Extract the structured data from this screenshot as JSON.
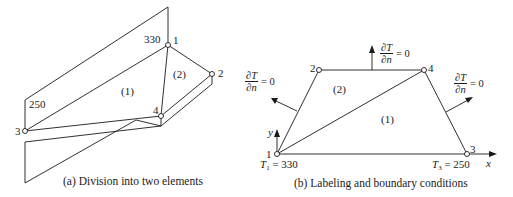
{
  "figure_a": {
    "caption": "(a) Division into two elements",
    "nodes": [
      {
        "id": "1",
        "label": "1",
        "value": "330"
      },
      {
        "id": "2",
        "label": "2"
      },
      {
        "id": "3",
        "label": "3",
        "value": "250"
      },
      {
        "id": "4",
        "label": "4"
      }
    ],
    "elements": [
      {
        "label": "(1)"
      },
      {
        "label": "(2)"
      }
    ]
  },
  "figure_b": {
    "caption": "(b) Labeling and boundary conditions",
    "nodes": [
      {
        "id": "1",
        "label": "1"
      },
      {
        "id": "2",
        "label": "2"
      },
      {
        "id": "3",
        "label": "3"
      },
      {
        "id": "4",
        "label": "4"
      }
    ],
    "elements": [
      {
        "label": "(1)"
      },
      {
        "label": "(2)"
      }
    ],
    "axes": {
      "x": "x",
      "y": "y"
    },
    "boundary_conditions": {
      "T1_sym": "T",
      "T1_sub": "1",
      "T1_value": "= 330",
      "T3_sym": "T",
      "T3_sub": "3",
      "T3_value": "= 250",
      "flux_num": "∂T",
      "flux_den": "∂n",
      "flux_value": "= 0"
    }
  }
}
